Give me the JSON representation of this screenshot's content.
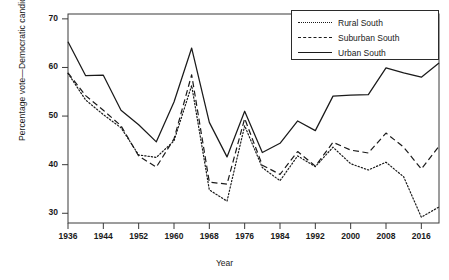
{
  "chart_data": {
    "type": "line",
    "title": "",
    "xlabel": "Year",
    "ylabel": "Percentage vote—Democratic candidate",
    "xlim": [
      1936,
      2020
    ],
    "ylim": [
      28,
      71
    ],
    "yticks": [
      30,
      40,
      50,
      60,
      70
    ],
    "xticks": [
      1936,
      1944,
      1952,
      1960,
      1968,
      1976,
      1984,
      1992,
      2000,
      2008,
      2016
    ],
    "grid": false,
    "legend_position": "top-right",
    "x": [
      1936,
      1940,
      1944,
      1948,
      1952,
      1956,
      1960,
      1964,
      1968,
      1972,
      1976,
      1980,
      1984,
      1988,
      1992,
      1996,
      2000,
      2004,
      2008,
      2012,
      2016,
      2020
    ],
    "series": [
      {
        "name": "Rural South",
        "style": "dotted",
        "color": "#1a1a1a",
        "values": [
          58.8,
          53.3,
          50.3,
          47.6,
          42.0,
          41.5,
          44.9,
          56.3,
          34.8,
          32.5,
          48.0,
          39.4,
          36.7,
          41.8,
          39.6,
          43.6,
          40.2,
          38.9,
          40.5,
          37.5,
          29.2,
          31.3
        ]
      },
      {
        "name": "Suburban South",
        "style": "dashed",
        "color": "#1a1a1a",
        "values": [
          58.9,
          54.2,
          51.2,
          48.0,
          41.8,
          39.5,
          45.3,
          58.5,
          36.4,
          36.0,
          49.5,
          39.9,
          38.0,
          42.7,
          39.7,
          44.6,
          43.0,
          42.4,
          46.5,
          43.6,
          39.1,
          43.8
        ]
      },
      {
        "name": "Urban South",
        "style": "solid",
        "color": "#1a1a1a",
        "values": [
          65.3,
          58.3,
          58.4,
          51.2,
          48.2,
          44.7,
          52.9,
          64.0,
          48.7,
          41.6,
          51.0,
          42.5,
          44.4,
          49.0,
          47.0,
          54.1,
          54.3,
          54.4,
          59.9,
          58.9,
          58.0,
          60.9
        ]
      }
    ]
  },
  "legend": {
    "items": [
      {
        "label": "Rural South",
        "style": "dotted"
      },
      {
        "label": "Suburban South",
        "style": "dashed"
      },
      {
        "label": "Urban South",
        "style": "solid"
      }
    ]
  }
}
